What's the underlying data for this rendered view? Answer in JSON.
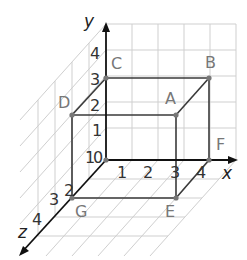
{
  "diagram": {
    "axes": {
      "x": {
        "label": "x",
        "ticks": [
          "1",
          "2",
          "3",
          "4"
        ]
      },
      "y": {
        "label": "y",
        "ticks": [
          "1",
          "2",
          "3",
          "4"
        ]
      },
      "z": {
        "label": "z",
        "ticks": [
          "1",
          "2",
          "3",
          "4"
        ]
      },
      "origin_label": "0"
    },
    "points": [
      {
        "name": "A",
        "coords": [
          3,
          2,
          0
        ]
      },
      {
        "name": "B",
        "coords": [
          4,
          3,
          0
        ]
      },
      {
        "name": "C",
        "coords": [
          0,
          3,
          0
        ]
      },
      {
        "name": "D",
        "coords": [
          0,
          2,
          2
        ]
      },
      {
        "name": "E",
        "coords": [
          3,
          0,
          2
        ]
      },
      {
        "name": "F",
        "coords": [
          4,
          0,
          0
        ]
      },
      {
        "name": "G",
        "coords": [
          0,
          0,
          2
        ]
      }
    ],
    "labels": {
      "A": "A",
      "B": "B",
      "C": "C",
      "D": "D",
      "E": "E",
      "F": "F",
      "G": "G"
    },
    "colors": {
      "grid": "#c8c8c8",
      "box": "#3a3a3a",
      "axis": "#111111",
      "point_label": "#777777",
      "tick": "#333333"
    }
  }
}
